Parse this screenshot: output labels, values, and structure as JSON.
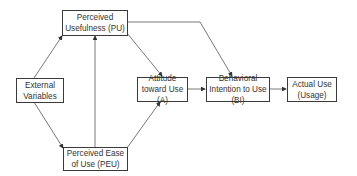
{
  "diagram": {
    "nodes": {
      "pu": {
        "label": "Perceived Usefulness (PU)"
      },
      "ext": {
        "label": "External Variables"
      },
      "att": {
        "label": "Attitude toward Use (A)"
      },
      "bi": {
        "label": "Behavioral Intention to Use (BI)"
      },
      "au": {
        "label": "Actual Use (Usage)"
      },
      "peu": {
        "label": "Perceived Ease of Use (PEU)"
      }
    },
    "edges": [
      {
        "from": "External Variables",
        "to": "Perceived Usefulness (PU)"
      },
      {
        "from": "External Variables",
        "to": "Perceived Ease of Use (PEU)"
      },
      {
        "from": "Perceived Ease of Use (PEU)",
        "to": "Perceived Usefulness (PU)"
      },
      {
        "from": "Perceived Ease of Use (PEU)",
        "to": "Attitude toward Use (A)"
      },
      {
        "from": "Perceived Usefulness (PU)",
        "to": "Attitude toward Use (A)"
      },
      {
        "from": "Perceived Usefulness (PU)",
        "to": "Behavioral Intention to Use (BI)"
      },
      {
        "from": "Attitude toward Use (A)",
        "to": "Behavioral Intention to Use (BI)"
      },
      {
        "from": "Behavioral Intention to Use (BI)",
        "to": "Actual Use (Usage)"
      }
    ]
  }
}
